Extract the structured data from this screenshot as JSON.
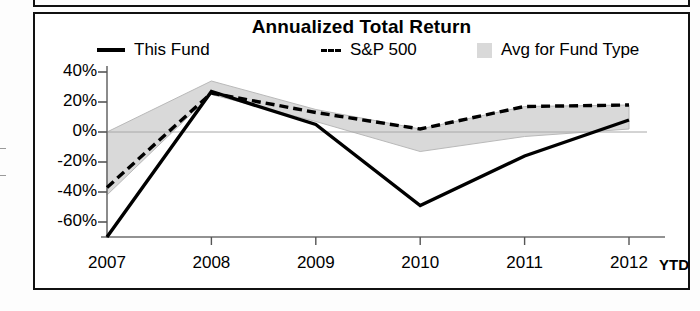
{
  "chart_data": {
    "type": "line",
    "title": "Annualized Total Return",
    "xlabel": "",
    "ylabel": "",
    "categories": [
      "2007",
      "2008",
      "2009",
      "2010",
      "2011",
      "2012"
    ],
    "x_axis_suffix": "YTD",
    "ylim": [
      -70,
      40
    ],
    "yticks": [
      40,
      20,
      0,
      -20,
      -40,
      -60
    ],
    "ytick_labels": [
      "40%",
      "20%",
      "0%",
      "-20%",
      "-40%",
      "-60%"
    ],
    "grid": false,
    "legend_position": "top",
    "series": [
      {
        "name": "This Fund",
        "style": "solid",
        "color": "#000000",
        "values": [
          -70,
          27,
          5,
          -49,
          -16,
          8
        ]
      },
      {
        "name": "S&P 500",
        "style": "dashed",
        "color": "#000000",
        "values": [
          -37,
          26,
          13,
          2,
          17,
          18
        ]
      },
      {
        "name": "Avg for Fund Type",
        "style": "band",
        "color": "#d9d9d9",
        "band_upper": [
          0,
          34,
          15,
          2,
          17,
          18
        ],
        "band_lower": [
          -42,
          25,
          7,
          -13,
          -3,
          2
        ]
      }
    ],
    "annotations": []
  },
  "legend": {
    "items": [
      {
        "label": "This Fund",
        "marker": "solid-line-swatch"
      },
      {
        "label": "S&P 500",
        "marker": "dashed-line-swatch",
        "prefix": "---"
      },
      {
        "label": "Avg for Fund Type",
        "marker": "gray-box-swatch"
      }
    ]
  },
  "axis": {
    "y_labels": [
      "40%",
      "20%",
      "0%",
      "-20%",
      "-40%",
      "-60%"
    ],
    "x_labels": [
      "2007",
      "2008",
      "2009",
      "2010",
      "2011",
      "2012"
    ],
    "x_suffix": "YTD"
  }
}
